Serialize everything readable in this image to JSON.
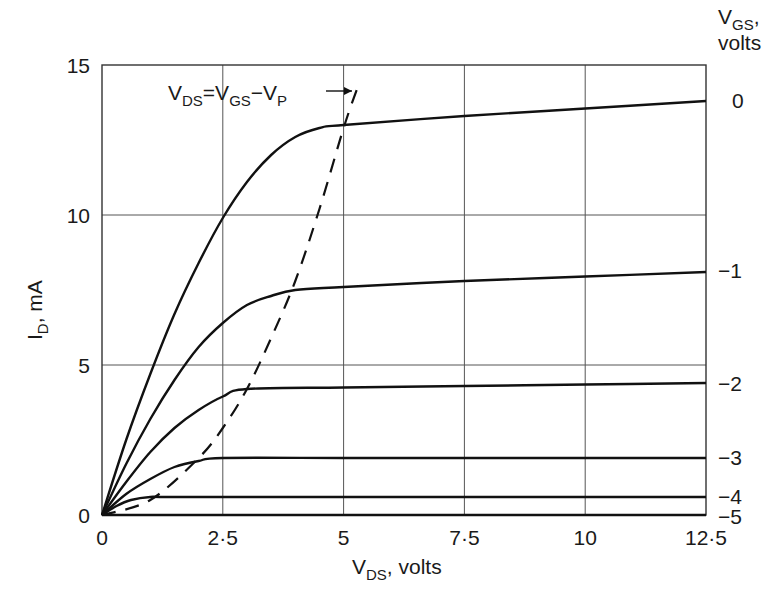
{
  "chart_data": {
    "type": "line",
    "title": "",
    "xlabel": "V_DS, volts",
    "ylabel": "I_D, mA",
    "xlabel_main": "V",
    "xlabel_sub": "DS",
    "xlabel_rest": ", volts",
    "ylabel_main": "I",
    "ylabel_sub": "D",
    "ylabel_rest": ", mA",
    "xlim": [
      0,
      12.5
    ],
    "ylim": [
      0,
      15
    ],
    "grid": true,
    "x_ticks": [
      "0",
      "2·5",
      "5",
      "7·5",
      "10",
      "12·5"
    ],
    "x_tick_values": [
      0,
      2.5,
      5,
      7.5,
      10,
      12.5
    ],
    "y_ticks": [
      "0",
      "5",
      "10",
      "15"
    ],
    "y_tick_values": [
      0,
      5,
      10,
      15
    ],
    "legend_title_main": "V",
    "legend_title_sub": "GS",
    "legend_title_rest": ",",
    "legend_title_line2": "volts",
    "legend_position": "right",
    "annotation": {
      "text_parts": [
        "V",
        "DS",
        "=V",
        "GS",
        "−V",
        "P"
      ],
      "text": "V_DS = V_GS − V_P",
      "arrow_to": [
        5.3,
        14.2
      ]
    },
    "series": [
      {
        "name": "0",
        "label": "0",
        "x": [
          0,
          0.5,
          1,
          1.5,
          2,
          2.5,
          3,
          3.5,
          4,
          4.5,
          5,
          7.5,
          10,
          12.5
        ],
        "values": [
          0,
          2.5,
          4.7,
          6.7,
          8.4,
          9.9,
          11.1,
          12.0,
          12.6,
          12.9,
          13.0,
          13.3,
          13.55,
          13.8
        ]
      },
      {
        "name": "-1",
        "label": "−1",
        "x": [
          0,
          0.5,
          1,
          1.5,
          2,
          2.5,
          3,
          3.5,
          4,
          5,
          7.5,
          10,
          12.5
        ],
        "values": [
          0,
          1.7,
          3.2,
          4.5,
          5.6,
          6.4,
          7.0,
          7.3,
          7.5,
          7.6,
          7.8,
          7.95,
          8.1
        ]
      },
      {
        "name": "-2",
        "label": "−2",
        "x": [
          0,
          0.5,
          1,
          1.5,
          2,
          2.5,
          3,
          5,
          7.5,
          10,
          12.5
        ],
        "values": [
          0,
          1.1,
          2.1,
          2.9,
          3.5,
          3.95,
          4.2,
          4.25,
          4.3,
          4.35,
          4.4
        ]
      },
      {
        "name": "-3",
        "label": "−3",
        "x": [
          0,
          0.5,
          1,
          1.5,
          2,
          2.5,
          5,
          7.5,
          10,
          12.5
        ],
        "values": [
          0,
          0.7,
          1.2,
          1.6,
          1.8,
          1.9,
          1.9,
          1.9,
          1.9,
          1.9
        ]
      },
      {
        "name": "-4",
        "label": "−4",
        "x": [
          0,
          0.3,
          0.6,
          1,
          1.5,
          5,
          12.5
        ],
        "values": [
          0,
          0.3,
          0.5,
          0.6,
          0.6,
          0.6,
          0.6
        ]
      },
      {
        "name": "-5",
        "label": "−5",
        "x": [
          0,
          12.5
        ],
        "values": [
          0,
          0
        ]
      }
    ],
    "pinchoff_locus": {
      "name": "V_DS = V_GS − V_P",
      "style": "dashed",
      "x": [
        0,
        1,
        2,
        2.5,
        3,
        3.5,
        4,
        4.5,
        5,
        5.3
      ],
      "values": [
        0,
        0.5,
        1.9,
        2.9,
        4.2,
        5.9,
        7.8,
        10.2,
        12.9,
        14.3
      ]
    }
  }
}
